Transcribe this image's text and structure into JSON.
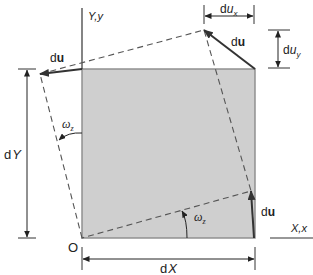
{
  "figure": {
    "type": "diagram",
    "colors": {
      "element_fill": "#cfcfcf",
      "element_stroke": "#8a8a8a",
      "lines": "#333333",
      "dashed": "#555555"
    },
    "axes": {
      "y_label": "Y,y",
      "x_label": "X,x"
    },
    "origin_label": "O",
    "dimensions": {
      "dX": {
        "prefix": "d",
        "var": "X"
      },
      "dY": {
        "prefix": "d",
        "var": "Y"
      },
      "dux": {
        "prefix": "d",
        "var": "u",
        "sub": "x"
      },
      "duy": {
        "prefix": "d",
        "var": "u",
        "sub": "y"
      }
    },
    "vectors": [
      {
        "id": "du-top-left",
        "label_prefix": "d",
        "label_bold": "u"
      },
      {
        "id": "du-top-right",
        "label_prefix": "d",
        "label_bold": "u"
      },
      {
        "id": "du-bottom-right",
        "label_prefix": "d",
        "label_bold": "u"
      }
    ],
    "angles": [
      {
        "id": "omega-left",
        "symbol": "ω",
        "sub": "z"
      },
      {
        "id": "omega-bottom",
        "symbol": "ω",
        "sub": "z"
      }
    ]
  }
}
